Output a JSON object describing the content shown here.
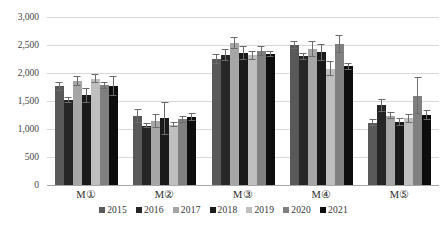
{
  "chart_data": {
    "type": "bar",
    "title": "",
    "subtitle": "",
    "xlabel": "",
    "ylabel": "",
    "ylim": [
      0,
      3000
    ],
    "yticks": [
      0,
      500,
      1000,
      1500,
      2000,
      2500,
      3000
    ],
    "ytick_labels": [
      "0",
      "500",
      "1,000",
      "1,500",
      "2,000",
      "2,500",
      "3,000"
    ],
    "grid": true,
    "legend_position": "bottom",
    "error_bars": true,
    "categories": [
      "M①",
      "M②",
      "M③",
      "M④",
      "M⑤"
    ],
    "series": [
      {
        "name": "2015",
        "color": "#595959",
        "values": [
          1760,
          1230,
          2250,
          2500,
          1110
        ],
        "errors": [
          75,
          130,
          90,
          70,
          60
        ]
      },
      {
        "name": "2016",
        "color": "#262626",
        "values": [
          1520,
          1060,
          2320,
          2300,
          1420
        ],
        "errors": [
          55,
          40,
          110,
          60,
          110
        ]
      },
      {
        "name": "2017",
        "color": "#a6a6a6",
        "values": [
          1860,
          1140,
          2540,
          2430,
          1240
        ],
        "errors": [
          90,
          120,
          110,
          140,
          70
        ]
      },
      {
        "name": "2018",
        "color": "#1a1a1a",
        "values": [
          1600,
          1190,
          2360,
          2370,
          1120
        ],
        "errors": [
          140,
          300,
          130,
          150,
          70
        ]
      },
      {
        "name": "2019",
        "color": "#bfbfbf",
        "values": [
          1900,
          1080,
          2320,
          2080,
          1190
        ],
        "errors": [
          80,
          40,
          80,
          130,
          80
        ]
      },
      {
        "name": "2020",
        "color": "#808080",
        "values": [
          1780,
          1170,
          2400,
          2510,
          1590
        ],
        "errors": [
          60,
          70,
          90,
          160,
          330
        ]
      },
      {
        "name": "2021",
        "color": "#0d0d0d",
        "values": [
          1770,
          1210,
          2340,
          2120,
          1250
        ],
        "errors": [
          180,
          70,
          60,
          60,
          90
        ]
      }
    ]
  }
}
